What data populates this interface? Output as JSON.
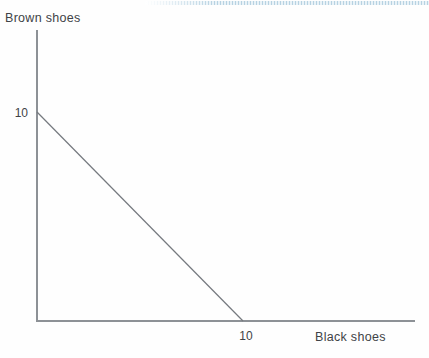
{
  "figure": {
    "title": ""
  },
  "colors": {
    "axis": "#8d9196",
    "budget_line": "#75797e",
    "text": "#3f4347",
    "top_strip_blue": "#b7d2e2"
  },
  "chart_data": {
    "type": "line",
    "title": "",
    "xlabel": "Black shoes",
    "ylabel": "Brown shoes",
    "x_ticks": [
      "10"
    ],
    "y_ticks": [
      "10"
    ],
    "xlim": [
      0,
      18.3
    ],
    "ylim": [
      0,
      14
    ],
    "grid": false,
    "legend": false,
    "series": [
      {
        "name": "budget-line",
        "points": [
          [
            0,
            10
          ],
          [
            10,
            0
          ]
        ]
      }
    ]
  }
}
